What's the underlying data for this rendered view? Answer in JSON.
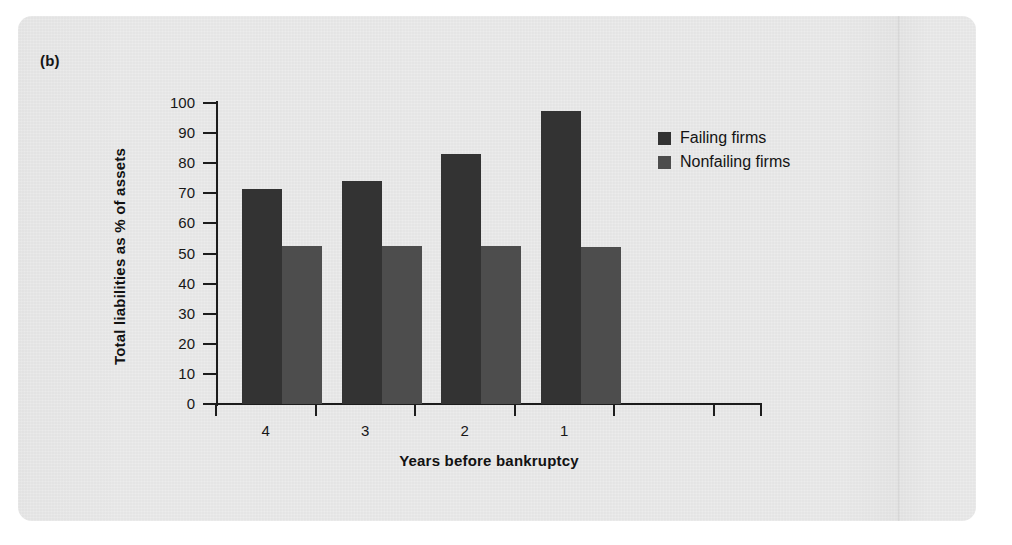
{
  "figure": {
    "panel_label": "(b)",
    "background_color": "#e7e7e7",
    "page_color": "#ffffff"
  },
  "chart_data": {
    "type": "bar",
    "title": "",
    "subtitle": "",
    "panel": "(b)",
    "xlabel": "Years before bankruptcy",
    "ylabel": "Total liabilities as % of assets",
    "categories": [
      "4",
      "3",
      "2",
      "1"
    ],
    "series": [
      {
        "name": "Failing firms",
        "color": "#333333",
        "values": [
          71.5,
          74.0,
          83.0,
          97.5
        ]
      },
      {
        "name": "Nonfailing firms",
        "color": "#4d4d4d",
        "values": [
          52.5,
          52.5,
          52.5,
          52.0
        ]
      }
    ],
    "ylim": [
      0,
      100
    ],
    "ytick_values": [
      0,
      10,
      20,
      30,
      40,
      50,
      60,
      70,
      80,
      90,
      100
    ],
    "ytick_labels": [
      "0",
      "10",
      "20",
      "30",
      "40",
      "50",
      "60",
      "70",
      "80",
      "90",
      "100"
    ],
    "grid": false,
    "legend_position": "upper right",
    "legend_entries": [
      "Failing firms",
      "Nonfailing firms"
    ],
    "annotations": []
  },
  "legend": {
    "items": [
      {
        "label": "Failing firms",
        "color": "#333333"
      },
      {
        "label": "Nonfailing firms",
        "color": "#4d4d4d"
      }
    ]
  }
}
